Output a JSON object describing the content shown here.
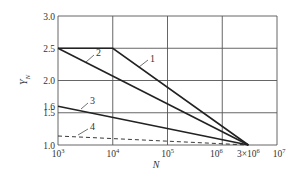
{
  "chart_data": {
    "type": "line",
    "title": "",
    "xlabel": "N",
    "ylabel": "Y_N",
    "xscale": "log",
    "xlim": [
      1000,
      10000000
    ],
    "ylim": [
      1.0,
      3.0
    ],
    "grid": true,
    "x_ticks": [
      {
        "value": 1000,
        "base": "10",
        "exp": "3"
      },
      {
        "value": 10000,
        "base": "10",
        "exp": "4"
      },
      {
        "value": 100000,
        "base": "10",
        "exp": "5"
      },
      {
        "value": 1000000,
        "base": "10",
        "exp": "6"
      },
      {
        "value": 3000000,
        "base": "3×10",
        "exp": "6"
      },
      {
        "value": 10000000,
        "base": "10",
        "exp": "7"
      }
    ],
    "y_ticks": [
      {
        "value": 1.0,
        "label": "1.0"
      },
      {
        "value": 1.5,
        "label": "1.5"
      },
      {
        "value": 1.6,
        "label": "1.6"
      },
      {
        "value": 2.0,
        "label": "2.0"
      },
      {
        "value": 2.5,
        "label": "2.5"
      },
      {
        "value": 3.0,
        "label": "3.0"
      }
    ],
    "y_gridlines": [
      1.0,
      1.5,
      2.0,
      2.5,
      3.0
    ],
    "x_gridlines": [
      1000,
      10000,
      100000,
      1000000,
      10000000
    ],
    "series": [
      {
        "name": "1",
        "style": "solid",
        "points": [
          [
            1000,
            2.5
          ],
          [
            10000,
            2.5
          ],
          [
            3000000,
            1.0
          ]
        ],
        "label_pos": [
          150,
          62
        ],
        "leader": [
          [
            148,
            60
          ],
          [
            139,
            67
          ]
        ]
      },
      {
        "name": "2",
        "style": "solid",
        "points": [
          [
            1000,
            2.5
          ],
          [
            3000000,
            1.0
          ]
        ],
        "label_pos": [
          96,
          56
        ],
        "leader": [
          [
            94,
            55
          ],
          [
            86,
            62
          ]
        ]
      },
      {
        "name": "3",
        "style": "solid",
        "points": [
          [
            1000,
            1.6
          ],
          [
            3000000,
            1.0
          ]
        ],
        "label_pos": [
          90,
          104
        ],
        "leader": [
          [
            88,
            103
          ],
          [
            81,
            109
          ]
        ]
      },
      {
        "name": "4",
        "style": "dashed",
        "points": [
          [
            1000,
            1.14
          ],
          [
            3000000,
            1.0
          ]
        ],
        "label_pos": [
          90,
          130
        ],
        "leader": [
          [
            88,
            129
          ],
          [
            78,
            135
          ]
        ]
      }
    ]
  },
  "axis": {
    "ylabel_main": "Y",
    "ylabel_sub": "N",
    "xlabel": "N"
  }
}
